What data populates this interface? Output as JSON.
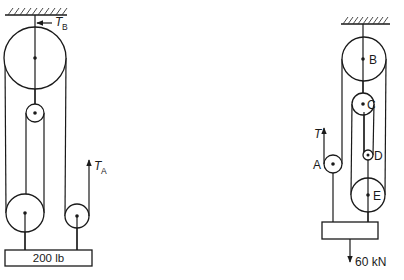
{
  "figure": {
    "left_system": {
      "name": "Pulley system with 200 lb load",
      "labels": {
        "tension_b": "T",
        "tension_b_sub": "B",
        "tension_a": "T",
        "tension_a_sub": "A",
        "load": "200 lb"
      }
    },
    "right_system": {
      "name": "Pulley system with 60 kN load",
      "labels": {
        "tension": "T",
        "pulley_a": "A",
        "pulley_b": "B",
        "pulley_c": "C",
        "pulley_d": "D",
        "pulley_e": "E",
        "load": "60 kN"
      }
    }
  }
}
